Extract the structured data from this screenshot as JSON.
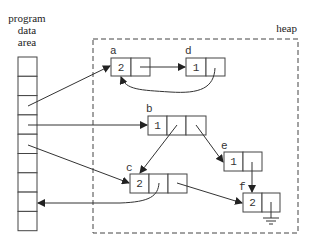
{
  "diagram": {
    "program_area_label": [
      "program",
      "data",
      "area"
    ],
    "heap_label": "heap",
    "program_area_cells": 9,
    "nodes": [
      {
        "id": "a",
        "label": "a",
        "count": "2",
        "fields": 1
      },
      {
        "id": "d",
        "label": "d",
        "count": "1",
        "fields": 1
      },
      {
        "id": "b",
        "label": "b",
        "count": "1",
        "fields": 2
      },
      {
        "id": "e",
        "label": "e",
        "count": "1",
        "fields": 1
      },
      {
        "id": "c",
        "label": "c",
        "count": "2",
        "fields": 2
      },
      {
        "id": "f",
        "label": "f",
        "count": "2",
        "fields": 1,
        "null_pointer": true
      }
    ],
    "edges": [
      {
        "from": "program-cell-3",
        "to": "a"
      },
      {
        "from": "program-cell-4",
        "to": "b"
      },
      {
        "from": "program-cell-5",
        "to": "c"
      },
      {
        "from": "a",
        "to": "d"
      },
      {
        "from": "d",
        "to": "a"
      },
      {
        "from": "b",
        "to": "c"
      },
      {
        "from": "b",
        "to": "e"
      },
      {
        "from": "e",
        "to": "f"
      },
      {
        "from": "c",
        "to": "f"
      },
      {
        "from": "c",
        "to": "program-cell-8"
      }
    ]
  }
}
